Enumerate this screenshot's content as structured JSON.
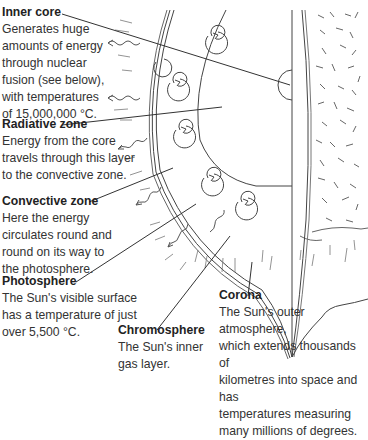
{
  "diagram": {
    "labels": [
      {
        "id": "inner-core",
        "title": "Inner core",
        "desc": [
          "Generates huge",
          "amounts of energy",
          "through nuclear",
          "fusion (see below),",
          "with temperatures",
          "of 15,000,000 °C."
        ]
      },
      {
        "id": "radiative-zone",
        "title": "Radiative zone",
        "desc": [
          "Energy from the core",
          "travels through this layer",
          "to the convective zone."
        ]
      },
      {
        "id": "convective-zone",
        "title": "Convective zone",
        "desc": [
          "Here the energy",
          "circulates round and",
          "round on its way to",
          "the photosphere."
        ]
      },
      {
        "id": "photosphere",
        "title": "Photosphere",
        "desc": [
          "The Sun's visible surface",
          "has a temperature of just",
          "over 5,500 °C."
        ]
      },
      {
        "id": "chromosphere",
        "title": "Chromosphere",
        "desc": [
          "The Sun's inner",
          "gas layer."
        ]
      },
      {
        "id": "corona",
        "title": "Corona",
        "desc": [
          "The Sun's outer atmosphere,",
          "which extends thousands of",
          "kilometres into space and has",
          "temperatures measuring",
          "many millions of degrees."
        ]
      }
    ],
    "colors": {
      "line": "#333333",
      "text": "#2a2a2a",
      "background": "#ffffff"
    }
  }
}
